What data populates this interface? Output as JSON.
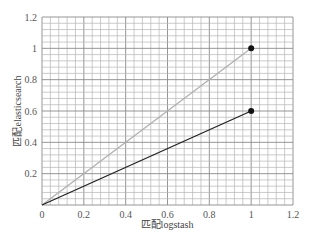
{
  "chart_data": {
    "type": "line",
    "title": "",
    "xlabel": "匹配logstash",
    "ylabel": "匹配elasticsearch",
    "xlim": [
      0,
      1.2
    ],
    "ylim": [
      0,
      1.2
    ],
    "x_ticks": [
      "0",
      "0.2",
      "0.4",
      "0.6",
      "0.8",
      "1",
      "1.2"
    ],
    "y_ticks": [
      "0",
      "0.2",
      "0.4",
      "0.6",
      "0.8",
      "1",
      "1.2"
    ],
    "grid": true,
    "minor_grid_step": 0.04,
    "legend": null,
    "series": [
      {
        "name": "gray-series",
        "color": "#b0b0b0",
        "points": [
          [
            0,
            0
          ],
          [
            1,
            1
          ]
        ],
        "marker_at_end": true
      },
      {
        "name": "black-series",
        "color": "#222222",
        "points": [
          [
            0,
            0
          ],
          [
            1,
            0.6
          ]
        ],
        "marker_at_end": true
      }
    ]
  },
  "colors": {
    "grid_major": "#8a8a8a",
    "grid_minor": "#b5b5b5",
    "marker": "#111111",
    "background": "#ffffff"
  }
}
